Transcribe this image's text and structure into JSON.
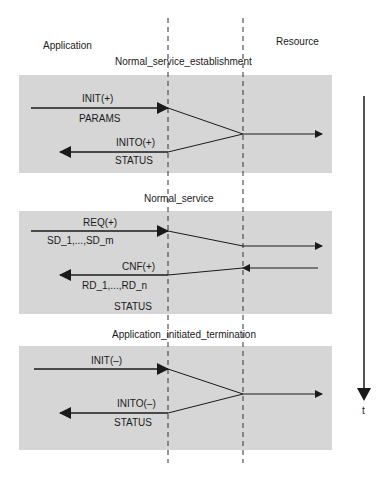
{
  "columns": {
    "left": "Application",
    "right": "Resource"
  },
  "time_axis": {
    "label": "t"
  },
  "sections": [
    {
      "title": "Normal_service_establishment",
      "labels": [
        "INIT(+)",
        "PARAMS",
        "INITO(+)",
        "STATUS"
      ]
    },
    {
      "title": "Normal_service",
      "labels": [
        "REQ(+)",
        "SD_1,...,SD_m",
        "CNF(+)",
        "RD_1,...,RD_n",
        "STATUS"
      ]
    },
    {
      "title": "Application_initiated_termination",
      "labels": [
        "INIT(–)",
        "INITO(–)",
        "STATUS"
      ]
    }
  ],
  "colors": {
    "box_fill": "#d6d6d6",
    "line": "#1a1a1a",
    "background": "#ffffff"
  }
}
